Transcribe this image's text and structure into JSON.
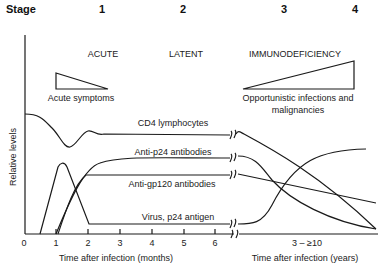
{
  "stages": {
    "title": "Stage",
    "items": [
      "1",
      "2",
      "3",
      "4"
    ]
  },
  "phases": {
    "acute": "ACUTE",
    "latent": "LATENT",
    "immunodeficiency": "IMMUNODEFICIENCY"
  },
  "annotations": {
    "acute_symptoms": "Acute symptoms",
    "opportunistic_line1": "Opportunistic infections and",
    "opportunistic_line2": "malignancies"
  },
  "curves": {
    "cd4": "CD4 lymphocytes",
    "anti_p24": "Anti-p24 antibodies",
    "anti_gp120": "Anti-gp120 antibodies",
    "virus": "Virus, p24 antigen"
  },
  "axes": {
    "ylabel": "Relative levels",
    "xlabel_months": "Time after infection (months)",
    "xlabel_years": "Time after infection (years)",
    "month_ticks": [
      "0",
      "1",
      "2",
      "3",
      "4",
      "5",
      "6"
    ],
    "year_tick": "3 – ≥10"
  },
  "colors": {
    "line": "#1a1a1a",
    "text": "#222222"
  }
}
